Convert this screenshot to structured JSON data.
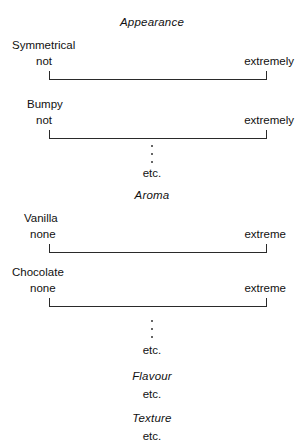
{
  "document": {
    "title": "Sensory Evaluation Ballot",
    "background_color": "#ffffff",
    "ink_color": "#1a1a1a"
  },
  "sections": [
    {
      "heading": "Appearance",
      "attributes": [
        {
          "name": "Symmetrical",
          "anchor_low": "not",
          "anchor_high": "extremely"
        },
        {
          "name": "Bumpy",
          "anchor_low": "not",
          "anchor_high": "extremely"
        }
      ],
      "continuation": "etc."
    },
    {
      "heading": "Aroma",
      "attributes": [
        {
          "name": "Vanilla",
          "anchor_low": "none",
          "anchor_high": "extreme"
        },
        {
          "name": "Chocolate",
          "anchor_low": "none",
          "anchor_high": "extreme"
        }
      ],
      "continuation": "etc."
    },
    {
      "heading": "Flavour",
      "attributes": [],
      "continuation": "etc."
    },
    {
      "heading": "Texture",
      "attributes": [],
      "continuation": "etc."
    }
  ],
  "labels": {
    "appearance_heading": "Appearance",
    "symmetrical_name": "Symmetrical",
    "symmetrical_low": "not",
    "symmetrical_high": "extremely",
    "bumpy_name": "Bumpy",
    "bumpy_low": "not",
    "bumpy_high": "extremely",
    "appearance_etc": "etc.",
    "aroma_heading": "Aroma",
    "vanilla_name": "Vanilla",
    "vanilla_low": "none",
    "vanilla_high": "extreme",
    "chocolate_name": "Chocolate",
    "chocolate_low": "none",
    "chocolate_high": "extreme",
    "aroma_etc": "etc.",
    "flavour_heading": "Flavour",
    "flavour_etc": "etc.",
    "texture_heading": "Texture",
    "texture_etc": "etc."
  }
}
